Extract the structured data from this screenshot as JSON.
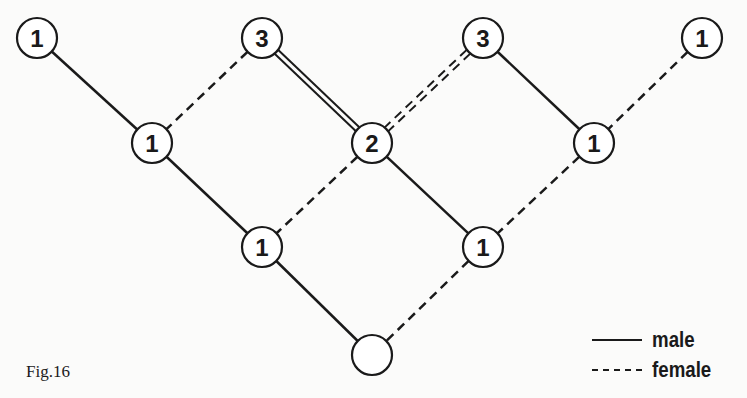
{
  "figure": {
    "caption": "Fig.16",
    "line_color": "#1a1a1a",
    "background": "#fbfbfa"
  },
  "nodes": [
    {
      "id": "a",
      "label": "1",
      "x": 37,
      "y": 38
    },
    {
      "id": "b",
      "label": "3",
      "x": 262,
      "y": 38
    },
    {
      "id": "c",
      "label": "3",
      "x": 483,
      "y": 38
    },
    {
      "id": "d",
      "label": "1",
      "x": 702,
      "y": 38
    },
    {
      "id": "e",
      "label": "1",
      "x": 152,
      "y": 143
    },
    {
      "id": "f",
      "label": "2",
      "x": 372,
      "y": 143
    },
    {
      "id": "g",
      "label": "1",
      "x": 594,
      "y": 143
    },
    {
      "id": "h",
      "label": "1",
      "x": 262,
      "y": 247
    },
    {
      "id": "i",
      "label": "1",
      "x": 483,
      "y": 247
    },
    {
      "id": "j",
      "label": "",
      "x": 372,
      "y": 355
    }
  ],
  "edges": [
    {
      "from": "a",
      "to": "e",
      "type": "male",
      "count": 1
    },
    {
      "from": "b",
      "to": "e",
      "type": "female",
      "count": 1
    },
    {
      "from": "b",
      "to": "f",
      "type": "male",
      "count": 2
    },
    {
      "from": "c",
      "to": "f",
      "type": "female",
      "count": 2
    },
    {
      "from": "c",
      "to": "g",
      "type": "male",
      "count": 1
    },
    {
      "from": "d",
      "to": "g",
      "type": "female",
      "count": 1
    },
    {
      "from": "e",
      "to": "h",
      "type": "male",
      "count": 1
    },
    {
      "from": "f",
      "to": "h",
      "type": "female",
      "count": 1
    },
    {
      "from": "f",
      "to": "i",
      "type": "male",
      "count": 1
    },
    {
      "from": "g",
      "to": "i",
      "type": "female",
      "count": 1
    },
    {
      "from": "h",
      "to": "j",
      "type": "male",
      "count": 1
    },
    {
      "from": "i",
      "to": "j",
      "type": "female",
      "count": 1
    }
  ],
  "legend": {
    "items": [
      {
        "label": "male",
        "style": "solid"
      },
      {
        "label": "female",
        "style": "dashed"
      }
    ]
  }
}
